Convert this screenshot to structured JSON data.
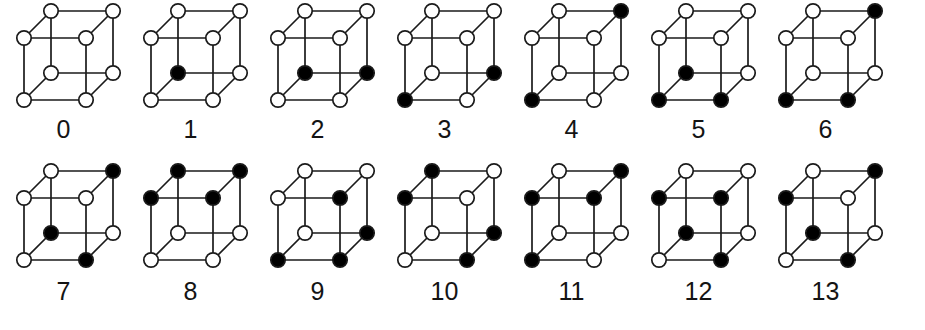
{
  "figure": {
    "vertex_count_per_cube": 8,
    "cube_count": 14,
    "colors": {
      "background": "#ffffff",
      "edge": "#1a1a1a",
      "vertex_empty_fill": "#ffffff",
      "vertex_filled_fill": "#000000",
      "vertex_stroke": "#1a1a1a",
      "label": "#141414"
    },
    "projection": {
      "type": "oblique",
      "front_face": [
        "front-top-left",
        "front-top-right",
        "front-bottom-right",
        "front-bottom-left"
      ],
      "back_face": [
        "back-top-left",
        "back-top-right",
        "back-bottom-right",
        "back-bottom-left"
      ],
      "depth_offset_x": 26,
      "depth_offset_y": -26
    },
    "vertex_names": [
      "front-bottom-left",
      "front-bottom-right",
      "front-top-left",
      "front-top-right",
      "back-bottom-left",
      "back-bottom-right",
      "back-top-left",
      "back-top-right"
    ],
    "rows": [
      {
        "row_index": 0,
        "cubes": [
          {
            "label": "0",
            "filled": [],
            "states": {
              "front-bottom-left": 0,
              "front-bottom-right": 0,
              "front-top-left": 0,
              "front-top-right": 0,
              "back-bottom-left": 0,
              "back-bottom-right": 0,
              "back-top-left": 0,
              "back-top-right": 0
            }
          },
          {
            "label": "1",
            "filled": [
              "back-bottom-left"
            ],
            "states": {
              "front-bottom-left": 0,
              "front-bottom-right": 0,
              "front-top-left": 0,
              "front-top-right": 0,
              "back-bottom-left": 1,
              "back-bottom-right": 0,
              "back-top-left": 0,
              "back-top-right": 0
            }
          },
          {
            "label": "2",
            "filled": [
              "back-bottom-left",
              "back-bottom-right"
            ],
            "states": {
              "front-bottom-left": 0,
              "front-bottom-right": 0,
              "front-top-left": 0,
              "front-top-right": 0,
              "back-bottom-left": 1,
              "back-bottom-right": 1,
              "back-top-left": 0,
              "back-top-right": 0
            }
          },
          {
            "label": "3",
            "filled": [
              "back-bottom-right",
              "front-bottom-left"
            ],
            "states": {
              "front-bottom-left": 1,
              "front-bottom-right": 0,
              "front-top-left": 0,
              "front-top-right": 0,
              "back-bottom-left": 0,
              "back-bottom-right": 1,
              "back-top-left": 0,
              "back-top-right": 0
            }
          },
          {
            "label": "4",
            "filled": [
              "back-top-right",
              "front-bottom-left"
            ],
            "states": {
              "front-bottom-left": 1,
              "front-bottom-right": 0,
              "front-top-left": 0,
              "front-top-right": 0,
              "back-bottom-left": 0,
              "back-bottom-right": 0,
              "back-top-left": 0,
              "back-top-right": 1
            }
          },
          {
            "label": "5",
            "filled": [
              "back-bottom-left",
              "front-bottom-left",
              "front-bottom-right"
            ],
            "states": {
              "front-bottom-left": 1,
              "front-bottom-right": 1,
              "front-top-left": 0,
              "front-top-right": 0,
              "back-bottom-left": 1,
              "back-bottom-right": 0,
              "back-top-left": 0,
              "back-top-right": 0
            }
          },
          {
            "label": "6",
            "filled": [
              "back-top-right",
              "front-bottom-left",
              "front-bottom-right"
            ],
            "states": {
              "front-bottom-left": 1,
              "front-bottom-right": 1,
              "front-top-left": 0,
              "front-top-right": 0,
              "back-bottom-left": 0,
              "back-bottom-right": 0,
              "back-top-left": 0,
              "back-top-right": 1
            }
          }
        ]
      },
      {
        "row_index": 1,
        "cubes": [
          {
            "label": "7",
            "filled": [
              "back-top-right",
              "back-bottom-left",
              "front-bottom-right"
            ],
            "states": {
              "front-bottom-left": 0,
              "front-bottom-right": 1,
              "front-top-left": 0,
              "front-top-right": 0,
              "back-bottom-left": 1,
              "back-bottom-right": 0,
              "back-top-left": 0,
              "back-top-right": 1
            }
          },
          {
            "label": "8",
            "filled": [
              "back-top-left",
              "back-top-right",
              "front-top-left",
              "front-top-right"
            ],
            "states": {
              "front-bottom-left": 0,
              "front-bottom-right": 0,
              "front-top-left": 1,
              "front-top-right": 1,
              "back-bottom-left": 0,
              "back-bottom-right": 0,
              "back-top-left": 1,
              "back-top-right": 1
            }
          },
          {
            "label": "9",
            "filled": [
              "back-bottom-right",
              "front-top-right",
              "front-bottom-left",
              "front-bottom-right"
            ],
            "states": {
              "front-bottom-left": 1,
              "front-bottom-right": 1,
              "front-top-left": 0,
              "front-top-right": 1,
              "back-bottom-left": 0,
              "back-bottom-right": 1,
              "back-top-left": 0,
              "back-top-right": 0
            }
          },
          {
            "label": "10",
            "filled": [
              "back-top-left",
              "back-bottom-right",
              "front-top-left",
              "front-bottom-right"
            ],
            "states": {
              "front-bottom-left": 0,
              "front-bottom-right": 1,
              "front-top-left": 1,
              "front-top-right": 0,
              "back-bottom-left": 0,
              "back-bottom-right": 1,
              "back-top-left": 1,
              "back-top-right": 0
            }
          },
          {
            "label": "11",
            "filled": [
              "back-top-right",
              "front-top-left",
              "front-top-right",
              "front-bottom-left"
            ],
            "states": {
              "front-bottom-left": 1,
              "front-bottom-right": 0,
              "front-top-left": 1,
              "front-top-right": 1,
              "back-bottom-left": 0,
              "back-bottom-right": 0,
              "back-top-left": 0,
              "back-top-right": 1
            }
          },
          {
            "label": "12",
            "filled": [
              "back-bottom-left",
              "front-top-left",
              "front-top-right",
              "front-bottom-right"
            ],
            "states": {
              "front-bottom-left": 0,
              "front-bottom-right": 1,
              "front-top-left": 1,
              "front-top-right": 1,
              "back-bottom-left": 1,
              "back-bottom-right": 0,
              "back-top-left": 0,
              "back-top-right": 0
            }
          },
          {
            "label": "13",
            "filled": [
              "back-top-right",
              "back-bottom-left",
              "front-top-left",
              "front-bottom-right"
            ],
            "states": {
              "front-bottom-left": 0,
              "front-bottom-right": 1,
              "front-top-left": 1,
              "front-top-right": 0,
              "back-bottom-left": 1,
              "back-bottom-right": 0,
              "back-top-left": 0,
              "back-top-right": 1
            }
          }
        ]
      }
    ]
  }
}
